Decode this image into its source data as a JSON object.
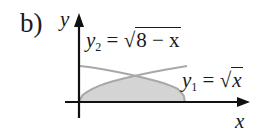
{
  "figure": {
    "part_label": "b)",
    "axes": {
      "x_label": "x",
      "y_label": "y"
    },
    "curves": [
      {
        "name": "y2",
        "var": "y",
        "sub": "2",
        "equals": "=",
        "sqrt_symbol": "√",
        "radicand": "8 − x",
        "expr": "y2 = √(8 − x)"
      },
      {
        "name": "y1",
        "var": "y",
        "sub": "1",
        "equals": "=",
        "sqrt_symbol": "√",
        "radicand": "x",
        "expr": "y1 = √x"
      }
    ],
    "shaded_region": "area under min(√x, √(8−x)) from x=0 to x=8",
    "colors": {
      "axis": "#111111",
      "curve": "#a8a8a8",
      "shade": "#d4d4d4"
    }
  }
}
